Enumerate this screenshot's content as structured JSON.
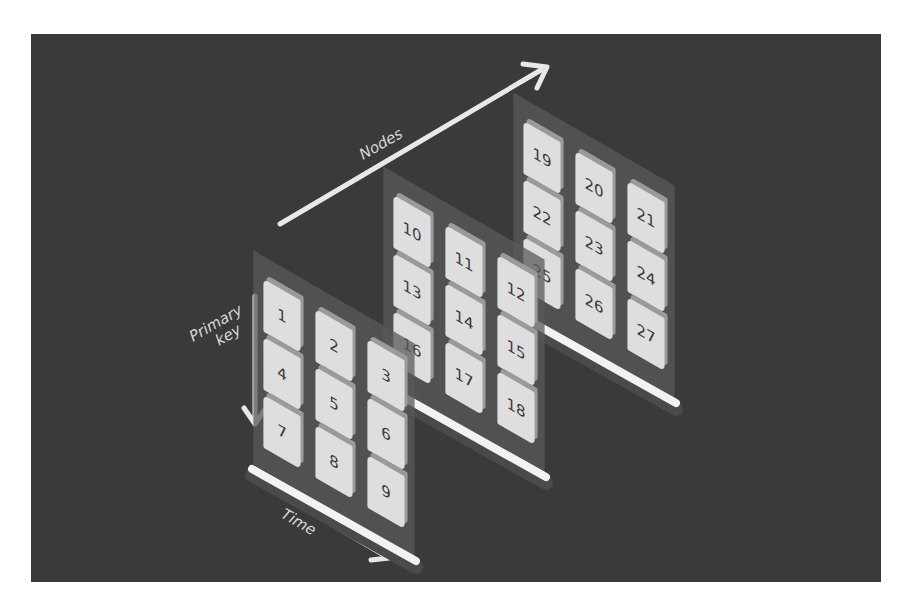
{
  "diagram": {
    "background_color": "#3a3a3a",
    "tile_color": "#dedede",
    "tile_edge_color": "#9a9a9a",
    "panel_color": "#5a5a5a",
    "rail_color": "#f2f2f2",
    "axes": {
      "nodes": {
        "label": "Nodes"
      },
      "primary_key": {
        "label_line1": "Primary",
        "label_line2": "key"
      },
      "time": {
        "label": "Time"
      }
    },
    "panels": [
      {
        "name": "node-1",
        "tiles": [
          "1",
          "2",
          "3",
          "4",
          "5",
          "6",
          "7",
          "8",
          "9"
        ]
      },
      {
        "name": "node-2",
        "tiles": [
          "10",
          "11",
          "12",
          "13",
          "14",
          "15",
          "16",
          "17",
          "18"
        ]
      },
      {
        "name": "node-3",
        "tiles": [
          "19",
          "20",
          "21",
          "22",
          "23",
          "24",
          "25",
          "26",
          "27"
        ]
      }
    ]
  }
}
